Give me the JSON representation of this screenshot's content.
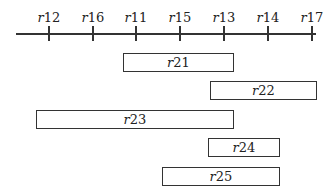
{
  "axis": {
    "line": {
      "x1": 16,
      "x2": 316,
      "y": 33
    },
    "ticks": [
      {
        "label": "r12",
        "x": 49
      },
      {
        "label": "r16",
        "x": 93
      },
      {
        "label": "r11",
        "x": 136
      },
      {
        "label": "r15",
        "x": 180
      },
      {
        "label": "r13",
        "x": 224
      },
      {
        "label": "r14",
        "x": 268
      },
      {
        "label": "r17",
        "x": 312
      }
    ]
  },
  "intervals": [
    {
      "label": "r21",
      "x1": 123,
      "x2": 234,
      "y1": 53,
      "y2": 72
    },
    {
      "label": "r22",
      "x1": 210,
      "x2": 317,
      "y1": 81,
      "y2": 100
    },
    {
      "label": "r23",
      "x1": 36,
      "x2": 234,
      "y1": 110,
      "y2": 129
    },
    {
      "label": "r24",
      "x1": 208,
      "x2": 280,
      "y1": 138,
      "y2": 157
    },
    {
      "label": "r25",
      "x1": 162,
      "x2": 280,
      "y1": 167,
      "y2": 186
    }
  ]
}
